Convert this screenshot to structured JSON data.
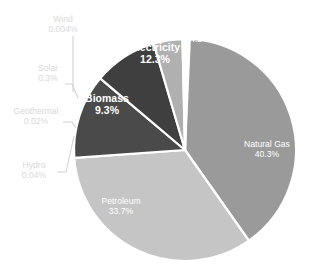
{
  "chart_data": {
    "type": "pie",
    "title": "",
    "subtitle": "",
    "legend_position": "none",
    "grid": false,
    "total_label": "100%",
    "categories": [
      "Natural Gas",
      "Petroleum",
      "Electricity",
      "Biomass",
      "Coal",
      "Solar",
      "Hydro",
      "Geothermal",
      "Wind"
    ],
    "values": [
      40.3,
      33.7,
      12.3,
      9.3,
      4.2,
      0.3,
      0.04,
      0.02,
      0.004
    ],
    "value_labels": [
      "40.3%",
      "33.7%",
      "12.3%",
      "9.3%",
      "4.2%",
      "0.3%",
      "0.04%",
      "0.02%",
      "0.004%"
    ],
    "colors": [
      "#9a9a9a",
      "#c5c5c5",
      "#4a4a4a",
      "#3f3f3f",
      "#b0b0b0",
      "#d0d0d0",
      "#d0d0d0",
      "#d0d0d0",
      "#d0d0d0"
    ],
    "slice_border_color": "#ffffff",
    "start_angle_deg": -90,
    "direction": "clockwise"
  },
  "slices": {
    "natural_gas": {
      "name": "Natural Gas",
      "percent": "40.3%",
      "color": "#9a9a9a"
    },
    "petroleum": {
      "name": "Petroleum",
      "percent": "33.7%",
      "color": "#c5c5c5"
    },
    "electricity": {
      "name": "Electricity",
      "percent": "12.3%",
      "color": "#4a4a4a"
    },
    "biomass": {
      "name": "Biomass",
      "percent": "9.3%",
      "color": "#3f3f3f"
    },
    "coal": {
      "name": "Coal",
      "percent": "4.2%",
      "color": "#b0b0b0"
    },
    "solar": {
      "name": "Solar",
      "percent": "0.3%",
      "color": "#d0d0d0"
    },
    "hydro": {
      "name": "Hydro",
      "percent": "0.04%",
      "color": "#d0d0d0"
    },
    "geothermal": {
      "name": "Geothermal",
      "percent": "0.02%",
      "color": "#d0d0d0"
    },
    "wind": {
      "name": "Wind",
      "percent": "0.004%",
      "color": "#d0d0d0"
    }
  },
  "style": {
    "background": "#ffffff",
    "outside_label_color": "#d9d9d9",
    "inside_label_color": "#ffffff",
    "leader_line_color": "#d2d2d2"
  }
}
